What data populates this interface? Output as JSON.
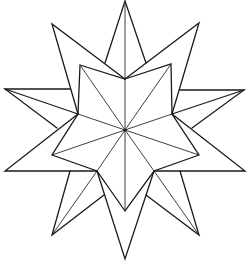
{
  "figure": {
    "title": ""
  },
  "colors": {
    "background": "#ffffff",
    "line": "#1a1a1a"
  },
  "geometry": {
    "center": [
      125,
      130
    ],
    "outer_tips": [
      [
        125,
        1
      ],
      [
        199,
        23
      ],
      [
        244,
        90
      ],
      [
        245,
        171
      ],
      [
        199,
        235
      ],
      [
        125,
        259
      ],
      [
        52,
        235
      ],
      [
        5,
        171
      ],
      [
        5,
        89
      ],
      [
        52,
        24
      ]
    ],
    "inner_star_points": [
      [
        80,
        65
      ],
      [
        171,
        64
      ],
      [
        199,
        155
      ],
      [
        125,
        211
      ],
      [
        52,
        155
      ]
    ],
    "inner_star_valleys": [
      [
        125,
        79
      ],
      [
        172,
        114
      ],
      [
        154,
        171
      ],
      [
        97,
        171
      ],
      [
        78,
        114
      ]
    ]
  }
}
